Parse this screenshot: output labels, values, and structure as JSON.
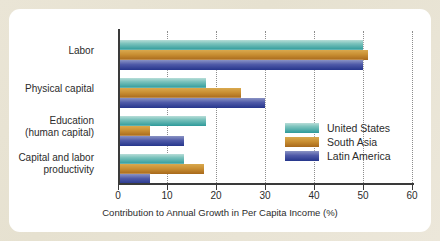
{
  "chart_data": {
    "type": "bar",
    "orientation": "horizontal",
    "title": "",
    "xlabel": "Contribution to Annual Growth in Per Capita Income (%)",
    "ylabel": "",
    "xlim": [
      0,
      60
    ],
    "xticks": [
      0,
      10,
      20,
      30,
      40,
      50,
      60
    ],
    "grid": "vertical-dotted",
    "legend_position": "center-right",
    "categories": [
      "Labor",
      "Physical capital",
      "Education\n(human capital)",
      "Capital and labor\nproductivity"
    ],
    "category_lines": [
      [
        "Labor"
      ],
      [
        "Physical capital"
      ],
      [
        "Education",
        "(human capital)"
      ],
      [
        "Capital and labor",
        "productivity"
      ]
    ],
    "series": [
      {
        "name": "United States",
        "color": "#2e9a9a",
        "values": [
          50.0,
          18.0,
          18.0,
          13.5
        ]
      },
      {
        "name": "South Asia",
        "color": "#c0872c",
        "values": [
          51.0,
          25.0,
          6.5,
          17.5
        ]
      },
      {
        "name": "Latin America",
        "color": "#3a49a0",
        "values": [
          50.0,
          30.0,
          13.5,
          6.5
        ]
      }
    ]
  },
  "axis": {
    "tick_labels": [
      "0",
      "10",
      "20",
      "30",
      "40",
      "50",
      "60"
    ],
    "title": "Contribution to Annual Growth in Per Capita Income (%)"
  },
  "legend": {
    "entries": [
      {
        "label": "United States"
      },
      {
        "label": "South Asia"
      },
      {
        "label": "Latin America"
      }
    ]
  },
  "colors": {
    "background": "#e9e4d4",
    "panel": "#ffffff",
    "axis": "#3a3a3a",
    "grid": "#8d8d8d",
    "united_states": "#2e9a9a",
    "south_asia": "#c0872c",
    "latin_america": "#3a49a0"
  }
}
